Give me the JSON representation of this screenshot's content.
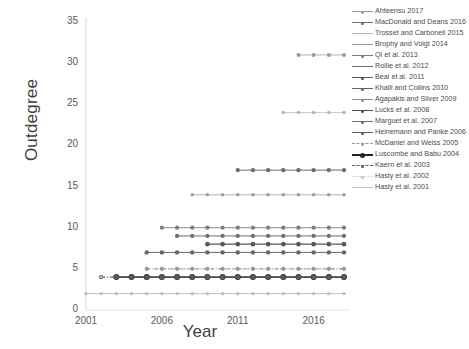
{
  "chart_data": {
    "type": "line",
    "title": "",
    "xlabel": "Year",
    "ylabel": "Outdegree",
    "xlim": [
      2001,
      2018
    ],
    "ylim": [
      0,
      35
    ],
    "xticks": [
      "2001",
      "2006",
      "2011",
      "2016"
    ],
    "xtick_values": [
      2001,
      2006,
      2011,
      2016
    ],
    "yticks": [
      "0",
      "5",
      "10",
      "15",
      "20",
      "25",
      "30",
      "35"
    ],
    "ytick_values": [
      0,
      5,
      10,
      15,
      20,
      25,
      30,
      35
    ],
    "grid": false,
    "legend_position": "right",
    "x": [
      2001,
      2002,
      2003,
      2004,
      2005,
      2006,
      2007,
      2008,
      2009,
      2010,
      2011,
      2012,
      2013,
      2014,
      2015,
      2016,
      2017,
      2018
    ],
    "series": [
      {
        "name": "Ahteensu 2017",
        "start_year": 2015,
        "value": 31,
        "color": "#9a9a9a",
        "dash": "none",
        "width": 0.8,
        "marker": 2.0,
        "values": [
          null,
          null,
          null,
          null,
          null,
          null,
          null,
          null,
          null,
          null,
          null,
          null,
          null,
          null,
          31,
          31,
          31,
          31
        ]
      },
      {
        "name": "MacDonald and Deans 2016",
        "start_year": 2011,
        "value": 17,
        "color": "#6e6e6e",
        "dash": "none",
        "width": 1.0,
        "marker": 2.2,
        "values": [
          null,
          null,
          null,
          null,
          null,
          null,
          null,
          null,
          null,
          null,
          17,
          17,
          17,
          17,
          17,
          17,
          17,
          17
        ]
      },
      {
        "name": "Trosset and Carbonell 2015",
        "start_year": 2014,
        "value": 24,
        "color": "#b5b5b5",
        "dash": "none",
        "width": 0.7,
        "marker": 1.8,
        "values": [
          null,
          null,
          null,
          null,
          null,
          null,
          null,
          null,
          null,
          null,
          null,
          null,
          null,
          24,
          24,
          24,
          24,
          24
        ]
      },
      {
        "name": "Brophy and Voigt 2014",
        "start_year": 2008,
        "value": 14,
        "color": "#9e9e9e",
        "dash": "none",
        "width": 0.8,
        "marker": 1.8,
        "values": [
          null,
          null,
          null,
          null,
          null,
          null,
          null,
          14,
          14,
          14,
          14,
          14,
          14,
          14,
          14,
          14,
          14,
          14
        ]
      },
      {
        "name": "Qi et al. 2013",
        "start_year": 2006,
        "value": 10,
        "color": "#7d7d7d",
        "dash": "none",
        "width": 0.9,
        "marker": 2.1,
        "values": [
          null,
          null,
          null,
          null,
          null,
          10,
          10,
          10,
          10,
          10,
          10,
          10,
          10,
          10,
          10,
          10,
          10,
          10
        ]
      },
      {
        "name": "Rollie et al. 2012",
        "start_year": 2007,
        "value": 9,
        "color": "#6f6f6f",
        "dash": "none",
        "width": 1.0,
        "marker": 2.1,
        "values": [
          null,
          null,
          null,
          null,
          null,
          null,
          9,
          9,
          9,
          9,
          9,
          9,
          9,
          9,
          9,
          9,
          9,
          9
        ]
      },
      {
        "name": "Beal et al. 2011",
        "start_year": 2009,
        "value": 8,
        "color": "#585858",
        "dash": "none",
        "width": 1.1,
        "marker": 2.3,
        "values": [
          null,
          null,
          null,
          null,
          null,
          null,
          null,
          null,
          8,
          8,
          8,
          8,
          8,
          8,
          8,
          8,
          8,
          8
        ]
      },
      {
        "name": "Khalil and Collins 2010",
        "start_year": 2005,
        "value": 7,
        "color": "#666666",
        "dash": "none",
        "width": 1.0,
        "marker": 2.2,
        "values": [
          null,
          null,
          null,
          null,
          7,
          7,
          7,
          7,
          7,
          7,
          7,
          7,
          7,
          7,
          7,
          7,
          7,
          7
        ]
      },
      {
        "name": "Agapakis and Silver 2009",
        "start_year": 2005,
        "value": 5,
        "color": "#8e8e8e",
        "dash": "dashdot",
        "width": 0.9,
        "marker": 2.0,
        "values": [
          null,
          null,
          null,
          null,
          5,
          5,
          5,
          5,
          5,
          5,
          5,
          5,
          5,
          5,
          5,
          5,
          5,
          5
        ]
      },
      {
        "name": "Lucks et al. 2008",
        "start_year": 2003,
        "value": 4,
        "color": "#4d4d4d",
        "dash": "none",
        "width": 1.2,
        "marker": 2.6,
        "values": [
          null,
          null,
          4,
          4,
          4,
          4,
          4,
          4,
          4,
          4,
          4,
          4,
          4,
          4,
          4,
          4,
          4,
          4
        ]
      },
      {
        "name": "Marguet et al. 2007",
        "start_year": 2002,
        "value": 4,
        "color": "#707070",
        "dash": "dotted",
        "width": 0.9,
        "marker": 1.6,
        "values": [
          null,
          4,
          4,
          4,
          4,
          4,
          4,
          4,
          4,
          4,
          4,
          4,
          4,
          4,
          4,
          4,
          4,
          4
        ]
      },
      {
        "name": "Heinemann and Panke 2006",
        "start_year": 2001,
        "value": 2,
        "color": "#aeaeae",
        "dash": "none",
        "width": 0.7,
        "marker": 1.6,
        "values": [
          2,
          2,
          2,
          2,
          2,
          2,
          2,
          2,
          2,
          2,
          2,
          2,
          2,
          2,
          2,
          2,
          2,
          2
        ]
      },
      {
        "name": "McDaniel and Weiss 2005",
        "start_year": 2005,
        "value": 5,
        "color": "#999999",
        "dash": "dashdot",
        "width": 0.8,
        "marker": 1.8,
        "values": [
          null,
          null,
          null,
          null,
          5,
          5,
          5,
          5,
          5,
          5,
          5,
          5,
          5,
          5,
          5,
          5,
          5,
          5
        ]
      },
      {
        "name": "Luscombe and Babu 2004",
        "start_year": 2003,
        "value": 4,
        "color": "#3b3b3b",
        "dash": "none",
        "width": 1.4,
        "marker": 3.0,
        "values": [
          null,
          null,
          4,
          4,
          4,
          4,
          4,
          4,
          4,
          4,
          4,
          4,
          4,
          4,
          4,
          4,
          4,
          4
        ]
      },
      {
        "name": "Kaern et al. 2003",
        "start_year": 2002,
        "value": 4,
        "color": "#5c5c5c",
        "dash": "dashdot",
        "width": 1.0,
        "marker": 2.2,
        "values": [
          null,
          4,
          4,
          4,
          4,
          4,
          4,
          4,
          4,
          4,
          4,
          4,
          4,
          4,
          4,
          4,
          4,
          4
        ]
      },
      {
        "name": "Hasty et al. 2002",
        "start_year": 2002,
        "value": 4,
        "color": "#c8c8c8",
        "dash": "dotted",
        "width": 0.6,
        "marker": 1.4,
        "values": [
          null,
          4,
          null,
          null,
          null,
          null,
          null,
          null,
          null,
          null,
          null,
          null,
          null,
          null,
          null,
          null,
          null,
          null
        ]
      },
      {
        "name": "Hasty et al. 2001",
        "start_year": 2001,
        "value": 2,
        "color": "#c2c2c2",
        "dash": "none",
        "width": 0.6,
        "marker": 1.4,
        "values": [
          2,
          2,
          2,
          2,
          2,
          2,
          2,
          2,
          2,
          2,
          2,
          2,
          2,
          2,
          2,
          2,
          2,
          2
        ]
      }
    ]
  },
  "legend": {
    "entries": [
      {
        "label": "Ahteensu 2017",
        "color": "#9a9a9a",
        "dash": "none",
        "width": 0.9,
        "marker": 2.2
      },
      {
        "label": "MacDonald and Deans 2016",
        "color": "#6e6e6e",
        "dash": "none",
        "width": 1.2,
        "marker": 2.4
      },
      {
        "label": "Trosset and Carbonell 2015",
        "color": "#b5b5b5",
        "dash": "none",
        "width": 0.8,
        "marker": 0
      },
      {
        "label": "Brophy and Voigt 2014",
        "color": "#9e9e9e",
        "dash": "none",
        "width": 0.9,
        "marker": 0
      },
      {
        "label": "Qi et al. 2013",
        "color": "#7d7d7d",
        "dash": "none",
        "width": 1.0,
        "marker": 2.2
      },
      {
        "label": "Rollie et al. 2012",
        "color": "#6f6f6f",
        "dash": "none",
        "width": 1.3,
        "marker": 0
      },
      {
        "label": "Beal et al. 2011",
        "color": "#585858",
        "dash": "none",
        "width": 1.2,
        "marker": 2.6
      },
      {
        "label": "Khalil and Collins 2010",
        "color": "#666666",
        "dash": "none",
        "width": 1.2,
        "marker": 2.4
      },
      {
        "label": "Agapakis and Silver 2009",
        "color": "#8e8e8e",
        "dash": "none",
        "width": 1.1,
        "marker": 2.2
      },
      {
        "label": "Lucks et al. 2008",
        "color": "#4d4d4d",
        "dash": "none",
        "width": 1.1,
        "marker": 2.2
      },
      {
        "label": "Marguet et al. 2007",
        "color": "#707070",
        "dash": "none",
        "width": 1.2,
        "marker": 2.4
      },
      {
        "label": "Heinemann and Panke 2006",
        "color": "#5a5a5a",
        "dash": "none",
        "width": 1.2,
        "marker": 2.4
      },
      {
        "label": "McDaniel and Weiss 2005",
        "color": "#999999",
        "dash": "dashdot",
        "width": 1.0,
        "marker": 2.0
      },
      {
        "label": "Luscombe and Babu 2004",
        "color": "#242424",
        "dash": "none",
        "width": 2.0,
        "marker": 3.6
      },
      {
        "label": "Kaern et al. 2003",
        "color": "#5c5c5c",
        "dash": "dashdot",
        "width": 1.2,
        "marker": 2.6
      },
      {
        "label": "Hasty et al. 2002",
        "color": "#c8c8c8",
        "dash": "dotted",
        "width": 0.7,
        "marker": 1.4
      },
      {
        "label": "Hasty et al. 2001",
        "color": "#c2c2c2",
        "dash": "none",
        "width": 0.8,
        "marker": 0
      }
    ]
  }
}
